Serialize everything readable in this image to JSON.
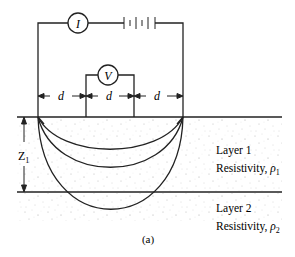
{
  "diagram": {
    "caption": "(a)",
    "ammeter_label": "I",
    "voltmeter_label": "V",
    "spacing_labels": [
      "d",
      "d",
      "d"
    ],
    "depth_label_main": "Z",
    "depth_label_sub": "1",
    "layers": [
      {
        "name": "Layer 1",
        "resistivity_prefix": "Resistivity, ",
        "symbol": "ρ",
        "sub": "1"
      },
      {
        "name": "Layer 2",
        "resistivity_prefix": "Resistivity, ",
        "symbol": "ρ",
        "sub": "2"
      }
    ],
    "colors": {
      "line": "#222222",
      "dots": "#9a9a9a",
      "background": "#ffffff"
    }
  }
}
